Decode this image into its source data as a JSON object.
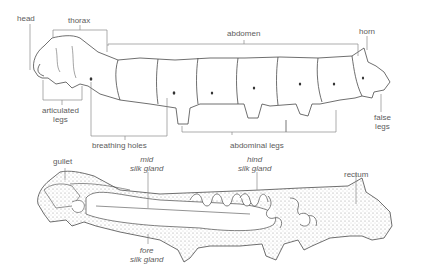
{
  "figure": {
    "external_view": {
      "labels": {
        "head": "head",
        "thorax": "thorax",
        "abdomen": "abdomen",
        "horn": "horn",
        "articulated_legs_1": "articulated",
        "articulated_legs_2": "legs",
        "breathing_holes": "breathing holes",
        "abdominal_legs": "abdominal legs",
        "false_legs_1": "false",
        "false_legs_2": "legs"
      }
    },
    "internal_view": {
      "labels": {
        "gullet": "gullet",
        "mid_silk_gland_1": "mid",
        "mid_silk_gland_2": "silk gland",
        "hind_silk_gland_1": "hind",
        "hind_silk_gland_2": "silk gland",
        "rectum": "rectum",
        "fore_silk_gland_1": "fore",
        "fore_silk_gland_2": "silk gland"
      }
    },
    "colors": {
      "line": "#4a4a4a",
      "leader": "#8a8a8a",
      "stipple": "#d9d9d9",
      "background": "#ffffff"
    }
  }
}
